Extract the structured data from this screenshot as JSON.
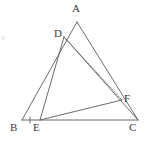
{
  "figure": {
    "type": "geometry-diagram",
    "canvas": {
      "width": 149,
      "height": 146,
      "background": "#ffffff"
    },
    "stroke_color": "#5a5a5a",
    "label_color": "#3a3a3a",
    "points": [
      {
        "id": "A",
        "label": "A",
        "x": 77,
        "y": 22,
        "label_x": 72,
        "label_y": 3
      },
      {
        "id": "D",
        "label": "D",
        "x": 64,
        "y": 37,
        "label_x": 54,
        "label_y": 28
      },
      {
        "id": "F",
        "label": "F",
        "x": 122,
        "y": 100,
        "label_x": 124,
        "label_y": 93
      },
      {
        "id": "B",
        "label": "B",
        "x": 22,
        "y": 120,
        "label_x": 10,
        "label_y": 122
      },
      {
        "id": "E",
        "label": "E",
        "x": 40,
        "y": 120,
        "label_x": 33,
        "label_y": 122
      },
      {
        "id": "C",
        "label": "C",
        "x": 138,
        "y": 120,
        "label_x": 129,
        "label_y": 122
      }
    ],
    "segments": [
      {
        "id": "AB",
        "from": "A",
        "to": "B",
        "style": "solid",
        "note": "triangle side"
      },
      {
        "id": "AC",
        "from": "A",
        "to": "C",
        "style": "solid",
        "note": "triangle side"
      },
      {
        "id": "BC",
        "from": "B",
        "to": "C",
        "style": "solid",
        "note": "triangle base"
      },
      {
        "id": "DE",
        "from": "D",
        "to": "E",
        "style": "solid",
        "note": "cevian"
      },
      {
        "id": "DC",
        "from": "D",
        "to": "C",
        "style": "solid",
        "note": "cevian"
      },
      {
        "id": "DF",
        "from": "D",
        "to": "F",
        "style": "dashed",
        "note": "dashed segment"
      },
      {
        "id": "EF",
        "from": "E",
        "to": "F",
        "style": "solid",
        "note": "cevian"
      }
    ],
    "tick_marks": [
      {
        "id": "tick-BE",
        "on_segment": "BE",
        "x": 30,
        "y": 120,
        "count": 1
      }
    ],
    "stray_marks": [
      {
        "id": "left-edge-artifact",
        "text": "o",
        "x": 1,
        "y": 34
      }
    ]
  }
}
